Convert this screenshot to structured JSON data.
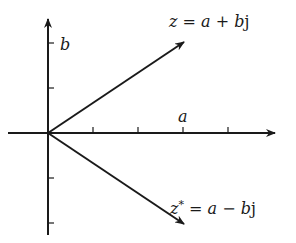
{
  "diagram": {
    "type": "complex-plane",
    "axes": {
      "real_label": "a",
      "imag_label": "b",
      "origin": [
        48,
        133
      ],
      "x_axis": {
        "from": [
          8,
          133
        ],
        "to": [
          276,
          133
        ]
      },
      "y_axis": {
        "from": [
          48,
          235
        ],
        "to": [
          48,
          18
        ]
      },
      "x_ticks": [
        93,
        138,
        183,
        228
      ],
      "y_ticks": [
        43,
        88,
        178,
        223
      ]
    },
    "vectors": [
      {
        "name": "z",
        "label": "z = a + bj",
        "from": [
          48,
          133
        ],
        "to": [
          185,
          42
        ]
      },
      {
        "name": "z-conjugate",
        "label": "z* = a − bj",
        "from": [
          48,
          133
        ],
        "to": [
          185,
          224
        ]
      }
    ],
    "labels": {
      "z": {
        "lhs": "z",
        "eq": " = ",
        "a": "a",
        "op": " + ",
        "b": "b",
        "j": "j"
      },
      "zconj": {
        "lhs": "z",
        "star": "*",
        "eq": " = ",
        "a": "a",
        "op": " − ",
        "b": "b",
        "j": "j"
      },
      "a": "a",
      "b": "b"
    },
    "colors": {
      "stroke": "#1a1a1a",
      "background": "#ffffff"
    }
  }
}
